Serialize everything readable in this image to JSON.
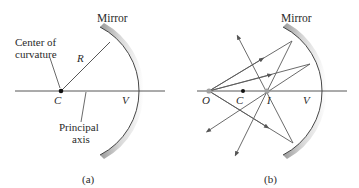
{
  "panel_a": {
    "mirror_label": "Mirror",
    "center_label_line1": "Center of",
    "center_label_line2": "curvature",
    "radius_label": "R",
    "center_point": "C",
    "vertex_point": "V",
    "axis_label_line1": "Principal",
    "axis_label_line2": "axis",
    "caption": "(a)"
  },
  "panel_b": {
    "mirror_label": "Mirror",
    "object_point": "O",
    "center_point": "C",
    "image_point": "I",
    "vertex_point": "V",
    "caption": "(b)"
  },
  "colors": {
    "line": "#4a4a4a",
    "ray": "#5a5a5a",
    "mirror_light": "#f2f2f2",
    "mirror_dark": "#b8b8b8",
    "point": "#111111",
    "source_point": "#a0a0a0"
  }
}
